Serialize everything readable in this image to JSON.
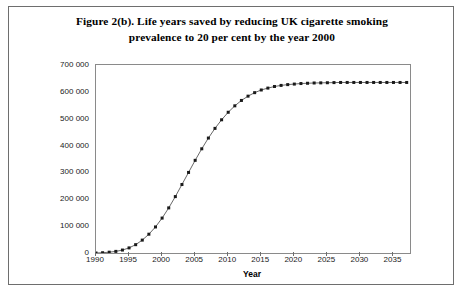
{
  "figure": {
    "title_line1": "Figure 2(b). Life years saved by reducing UK cigarette smoking",
    "title_line2": "prevalence to 20 per cent by the year 2000"
  },
  "chart_data": {
    "type": "line",
    "title": "Figure 2(b). Life years saved by reducing UK cigarette smoking prevalence to 20 per cent by the year 2000",
    "xlabel": "Year",
    "ylabel": "",
    "xlim": [
      1990,
      2037.5
    ],
    "ylim": [
      0,
      700000
    ],
    "grid": false,
    "legend": null,
    "marker": "filled-square",
    "line_color": "#404040",
    "marker_color": "#1a1a1a",
    "xticks": [
      1990,
      1995,
      2000,
      2005,
      2010,
      2015,
      2020,
      2025,
      2030,
      2035
    ],
    "xtick_labels": [
      "1990",
      "1995",
      "2000",
      "2005",
      "2010",
      "2015",
      "2020",
      "2025",
      "2030",
      "2035"
    ],
    "yticks": [
      0,
      100000,
      200000,
      300000,
      400000,
      500000,
      600000,
      700000
    ],
    "ytick_labels": [
      "0",
      "100 000",
      "200 000",
      "300 000",
      "400 000",
      "500 000",
      "600 000",
      "700 000"
    ],
    "series": [
      {
        "name": "Life years saved",
        "x": [
          1990,
          1991,
          1992,
          1993,
          1994,
          1995,
          1996,
          1997,
          1998,
          1999,
          2000,
          2001,
          2002,
          2003,
          2004,
          2005,
          2006,
          2007,
          2008,
          2009,
          2010,
          2011,
          2012,
          2013,
          2014,
          2015,
          2016,
          2017,
          2018,
          2019,
          2020,
          2021,
          2022,
          2023,
          2024,
          2025,
          2026,
          2027,
          2028,
          2029,
          2030,
          2031,
          2032,
          2033,
          2034,
          2035,
          2036,
          2037
        ],
        "values": [
          0,
          1000,
          3000,
          6000,
          11000,
          19000,
          31000,
          48000,
          70000,
          97000,
          130000,
          168000,
          210000,
          255000,
          300000,
          345000,
          388000,
          428000,
          464000,
          496000,
          524000,
          548000,
          568000,
          584000,
          597000,
          607000,
          614000,
          620000,
          624000,
          627000,
          629000,
          631000,
          632000,
          633000,
          633500,
          634000,
          634500,
          635000,
          635000,
          635000,
          635000,
          635000,
          635000,
          635000,
          635000,
          635000,
          635000,
          635000
        ]
      }
    ]
  }
}
